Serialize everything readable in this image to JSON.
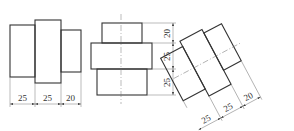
{
  "figures": [
    {
      "name": "front-view",
      "dimensions": [
        "25",
        "25",
        "20"
      ],
      "orientation": "horizontal"
    },
    {
      "name": "vertical-view",
      "dimensions": [
        "20",
        "25",
        "25"
      ],
      "orientation": "vertical"
    },
    {
      "name": "rotated-view",
      "dimensions": [
        "25",
        "25",
        "20"
      ],
      "orientation": "rotated"
    }
  ],
  "colors": {
    "line": "#333333",
    "thin_line": "#777777",
    "background": "#ffffff"
  }
}
